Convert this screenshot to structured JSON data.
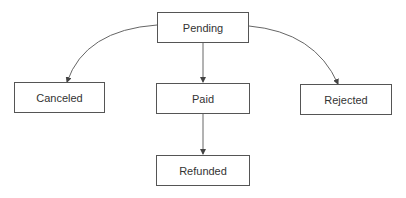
{
  "diagram": {
    "type": "state-flow",
    "nodes": [
      {
        "id": "pending",
        "label": "Pending"
      },
      {
        "id": "canceled",
        "label": "Canceled"
      },
      {
        "id": "paid",
        "label": "Paid"
      },
      {
        "id": "rejected",
        "label": "Rejected"
      },
      {
        "id": "refunded",
        "label": "Refunded"
      }
    ],
    "edges": [
      {
        "from": "pending",
        "to": "canceled"
      },
      {
        "from": "pending",
        "to": "paid"
      },
      {
        "from": "pending",
        "to": "rejected"
      },
      {
        "from": "paid",
        "to": "refunded"
      }
    ],
    "colors": {
      "line": "#555555",
      "text": "#333333",
      "background": "#ffffff"
    }
  }
}
